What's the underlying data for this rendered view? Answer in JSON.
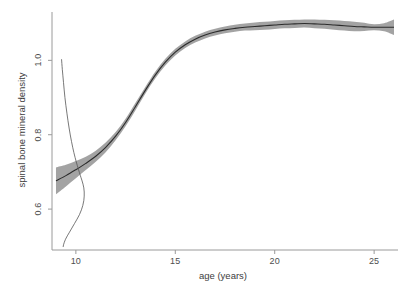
{
  "chart_data": {
    "type": "line",
    "title": "",
    "xlabel": "age (years)",
    "ylabel": "spinal bone mineral density",
    "xlim": [
      8.8,
      26.2
    ],
    "ylim": [
      0.49,
      1.13
    ],
    "xticks": [
      10,
      15,
      20,
      25
    ],
    "xtick_labels": [
      "10",
      "15",
      "20",
      "25"
    ],
    "yticks": [
      0.6,
      0.8,
      1.0
    ],
    "ytick_labels": [
      "0.6",
      "0.8",
      "1.0"
    ],
    "grid": false,
    "legend": "none",
    "series": [
      {
        "name": "fitted spline",
        "style": "line",
        "color": "#2b2b2b",
        "x": [
          9.0,
          9.5,
          10.0,
          10.5,
          11.0,
          11.5,
          12.0,
          12.5,
          13.0,
          13.5,
          14.0,
          14.5,
          15.0,
          15.5,
          16.0,
          16.5,
          17.0,
          17.5,
          18.0,
          18.5,
          19.0,
          19.5,
          20.0,
          20.5,
          21.0,
          21.5,
          22.0,
          22.5,
          23.0,
          23.5,
          24.0,
          24.5,
          25.0,
          25.5,
          26.0
        ],
        "y": [
          0.676,
          0.69,
          0.706,
          0.723,
          0.742,
          0.766,
          0.796,
          0.833,
          0.876,
          0.92,
          0.961,
          0.995,
          1.022,
          1.042,
          1.057,
          1.068,
          1.076,
          1.082,
          1.086,
          1.089,
          1.091,
          1.093,
          1.095,
          1.097,
          1.098,
          1.099,
          1.098,
          1.097,
          1.095,
          1.093,
          1.091,
          1.09,
          1.089,
          1.089,
          1.089
        ]
      },
      {
        "name": "confidence band upper",
        "style": "band-upper",
        "color": "#9e9e9e",
        "x": [
          9.0,
          9.5,
          10.0,
          10.5,
          11.0,
          11.5,
          12.0,
          12.5,
          13.0,
          13.5,
          14.0,
          14.5,
          15.0,
          15.5,
          16.0,
          16.5,
          17.0,
          17.5,
          18.0,
          18.5,
          19.0,
          19.5,
          20.0,
          20.5,
          21.0,
          21.5,
          22.0,
          22.5,
          23.0,
          23.5,
          24.0,
          24.5,
          25.0,
          25.5,
          26.0
        ],
        "y": [
          0.712,
          0.719,
          0.729,
          0.741,
          0.757,
          0.779,
          0.807,
          0.843,
          0.886,
          0.929,
          0.97,
          1.004,
          1.031,
          1.051,
          1.066,
          1.077,
          1.085,
          1.091,
          1.096,
          1.099,
          1.102,
          1.104,
          1.106,
          1.108,
          1.109,
          1.11,
          1.11,
          1.109,
          1.108,
          1.106,
          1.104,
          1.101,
          1.097,
          1.1,
          1.11
        ]
      },
      {
        "name": "confidence band lower",
        "style": "band-lower",
        "color": "#9e9e9e",
        "x": [
          9.0,
          9.5,
          10.0,
          10.5,
          11.0,
          11.5,
          12.0,
          12.5,
          13.0,
          13.5,
          14.0,
          14.5,
          15.0,
          15.5,
          16.0,
          16.5,
          17.0,
          17.5,
          18.0,
          18.5,
          19.0,
          19.5,
          20.0,
          20.5,
          21.0,
          21.5,
          22.0,
          22.5,
          23.0,
          23.5,
          24.0,
          24.5,
          25.0,
          25.5,
          26.0
        ],
        "y": [
          0.64,
          0.661,
          0.683,
          0.705,
          0.727,
          0.753,
          0.785,
          0.823,
          0.866,
          0.911,
          0.952,
          0.986,
          1.013,
          1.033,
          1.048,
          1.059,
          1.067,
          1.073,
          1.077,
          1.08,
          1.081,
          1.082,
          1.084,
          1.086,
          1.087,
          1.088,
          1.086,
          1.085,
          1.082,
          1.08,
          1.078,
          1.079,
          1.081,
          1.078,
          1.068
        ]
      },
      {
        "name": "marginal density curve",
        "style": "thin-line",
        "color": "#555555",
        "x": [
          9.28,
          9.32,
          9.38,
          9.45,
          9.55,
          9.66,
          9.78,
          9.9,
          10.02,
          10.13,
          10.22,
          10.3,
          10.36,
          10.4,
          10.42,
          10.42,
          10.4,
          10.35,
          10.28,
          10.18,
          10.06,
          9.93,
          9.8,
          9.68,
          9.57,
          9.48,
          9.42,
          9.38,
          9.36
        ],
        "y": [
          1.003,
          0.975,
          0.94,
          0.9,
          0.858,
          0.818,
          0.782,
          0.752,
          0.727,
          0.707,
          0.691,
          0.678,
          0.667,
          0.657,
          0.646,
          0.635,
          0.623,
          0.61,
          0.598,
          0.585,
          0.573,
          0.561,
          0.549,
          0.538,
          0.528,
          0.519,
          0.511,
          0.504,
          0.498
        ]
      }
    ],
    "annotations": []
  },
  "axes": {
    "x_title": "age (years)",
    "y_title": "spinal bone mineral density",
    "x_tick_labels": [
      "10",
      "15",
      "20",
      "25"
    ],
    "y_tick_labels": [
      "0.6",
      "0.8",
      "1.0"
    ]
  },
  "colors": {
    "band": "#9e9e9e",
    "line": "#2b2b2b",
    "axis": "#9a9a9a",
    "text": "#4d4d4d",
    "background": "#ffffff"
  }
}
